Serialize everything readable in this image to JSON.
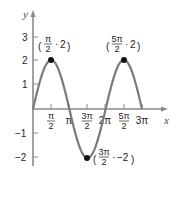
{
  "chart_data": {
    "type": "line",
    "title": "",
    "xlabel": "x",
    "ylabel": "y",
    "function": "y = 2 sin x",
    "x_ticks": [
      "π/2",
      "π",
      "3π/2",
      "2π",
      "5π/2",
      "3π"
    ],
    "x_tick_values": [
      1.5708,
      3.1416,
      4.7124,
      6.2832,
      7.854,
      9.4248
    ],
    "y_ticks": [
      "3",
      "2",
      "1",
      "-1",
      "-2"
    ],
    "y_tick_values": [
      3,
      2,
      1,
      -1,
      -2
    ],
    "xlim": [
      0,
      9.4248
    ],
    "ylim": [
      -2.5,
      3.5
    ],
    "grid": false,
    "series": [
      {
        "name": "y = 2 sin x",
        "x": [
          0,
          0.7854,
          1.5708,
          2.3562,
          3.1416,
          3.927,
          4.7124,
          5.4978,
          6.2832,
          7.0686,
          7.854,
          8.6394,
          9.4248
        ],
        "values": [
          0,
          1.414,
          2,
          1.414,
          0,
          -1.414,
          -2,
          -1.414,
          0,
          1.414,
          2,
          1.414,
          0
        ]
      }
    ],
    "annotations": [
      {
        "label": "(π/2, 2)",
        "x": 1.5708,
        "y": 2
      },
      {
        "label": "(5π/2, 2)",
        "x": 7.854,
        "y": 2
      },
      {
        "label": "(3π/2, -2)",
        "x": 4.7124,
        "y": -2
      }
    ]
  },
  "labels": {
    "y_axis": "y",
    "x_axis": "x",
    "y3": "3",
    "y2": "2",
    "y1": "1",
    "ym1": "−1",
    "ym2": "−2",
    "pt1_num": "π",
    "pt1_den": "2",
    "pt1_y": "2",
    "pt2_num": "5π",
    "pt2_den": "2",
    "pt2_y": "2",
    "pt3_num": "3π",
    "pt3_den": "2",
    "pt3_y": "−2",
    "xt1_num": "π",
    "xt1_den": "2",
    "xt2": "π",
    "xt3_num": "3π",
    "xt3_den": "2",
    "xt4": "2π",
    "xt5_num": "5π",
    "xt5_den": "2",
    "xt6": "3π"
  },
  "colors": {
    "curve": "#7a7a7a",
    "axis": "#8a8a8a",
    "point": "#111111",
    "text": "#222222"
  }
}
